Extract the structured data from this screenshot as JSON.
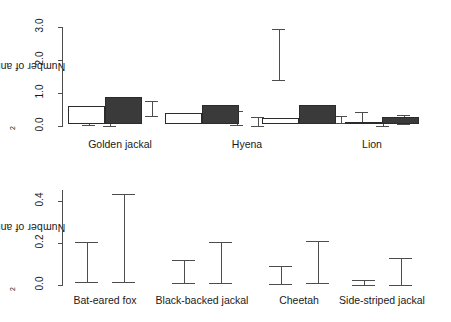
{
  "chart_data": [
    {
      "type": "bar",
      "panel": "top",
      "title": "",
      "xlabel": "",
      "ylabel": "Number of animals per km2",
      "ylabel_display": "Number of animals per km",
      "ylabel_superscript": "2",
      "ylim": [
        0,
        3.0
      ],
      "yticks": [
        0.0,
        1.0,
        2.0,
        3.0
      ],
      "ytick_labels": [
        "0.0",
        "1.0",
        "2.0",
        "3.0"
      ],
      "grid": false,
      "legend": "none",
      "categories": [
        "Golden jackal",
        "Hyena",
        "Lion"
      ],
      "series": [
        {
          "name": "series-1-white",
          "fill": "white",
          "values": [
            0.08,
            0.42,
            0.18
          ],
          "err_low": [
            0.02,
            0.24,
            0.09
          ],
          "err_high": [
            0.22,
            0.61,
            0.3
          ]
        },
        {
          "name": "series-2-hatched",
          "fill": "hatch",
          "values": [
            0.05,
            0.15,
            0.2
          ],
          "err_low": [
            0.01,
            0.02,
            0.1
          ],
          "err_high": [
            0.13,
            0.44,
            0.41
          ]
        },
        {
          "name": "series-3-gray",
          "fill": "gray",
          "values": [
            0.28,
            0.12,
            0.04
          ],
          "err_low": [
            0.1,
            0.01,
            0.01
          ],
          "err_high": [
            0.52,
            0.27,
            0.1
          ]
        },
        {
          "name": "series-4-dark",
          "fill": "dark",
          "values": [
            0.52,
            2.2,
            0.15
          ],
          "err_low": [
            0.3,
            1.4,
            0.06
          ],
          "err_high": [
            0.76,
            2.94,
            0.33
          ]
        }
      ]
    },
    {
      "type": "bar",
      "panel": "bottom",
      "title": "",
      "xlabel": "",
      "ylabel": "Number of animals per km2",
      "ylabel_display": "Number of animals per km",
      "ylabel_superscript": "2",
      "ylim": [
        0,
        0.45
      ],
      "yticks": [
        0.0,
        0.2,
        0.4
      ],
      "ytick_labels": [
        "0.0",
        "0.2",
        "0.4"
      ],
      "grid": false,
      "legend": "none",
      "categories": [
        "Bat-eared fox",
        "Black-backed jackal",
        "Cheetah",
        "Side-striped jackal"
      ],
      "series": [
        {
          "name": "series-1-white",
          "fill": "white",
          "values": [
            0.085,
            0.05,
            0.03,
            0.008
          ],
          "err_low": [
            0.012,
            0.008,
            0.004,
            0.001
          ],
          "err_high": [
            0.205,
            0.12,
            0.092,
            0.022
          ]
        },
        {
          "name": "series-2-dark",
          "fill": "dark",
          "values": [
            0.13,
            0.09,
            0.09,
            0.035
          ],
          "err_low": [
            0.015,
            0.01,
            0.008,
            0.002
          ],
          "err_high": [
            0.43,
            0.205,
            0.21,
            0.13
          ]
        }
      ]
    }
  ],
  "colors": {
    "white_fill": "#ffffff",
    "gray_fill": "#a9a9a9",
    "dark_fill": "#3a3a3a",
    "outline": "#2b2b2b",
    "axis": "#4d4d4d",
    "text": "#1a1a1a",
    "background": "#ffffff"
  }
}
